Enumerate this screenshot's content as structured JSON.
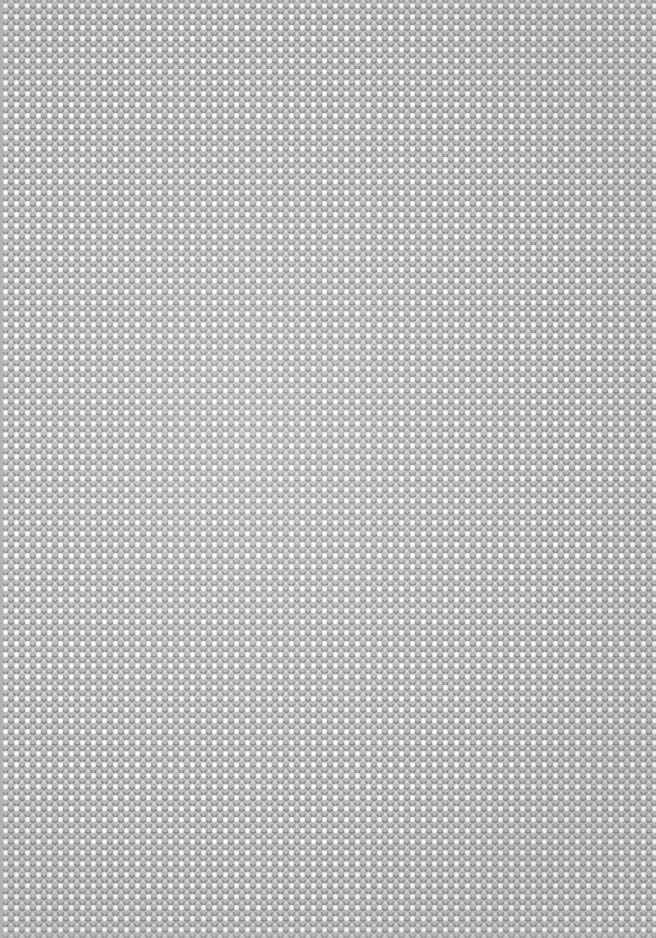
{
  "image": {
    "kind": "abstract-texture",
    "description": "Seamless pixelated halftone dot-lattice weave texture filling the entire frame",
    "width": 656,
    "height": 938,
    "has_text": false,
    "has_ui_controls": false
  },
  "pattern": {
    "name": "dot-lattice-weave",
    "motif": "bright round dots on a square lattice with half-period offset dimmer dots, separated by dark diagonal diamond crosshatching",
    "period_px": 11,
    "period_x_px": 11,
    "period_y_px": 11,
    "lattice": "square",
    "secondary_lattice": "quincunx (offset by half period)",
    "dot_diameter_px": 3.4,
    "dim_dot_diameter_px": 3.1,
    "rendering": "nearest-neighbour pixelated",
    "diagonal_angles_deg": [
      45,
      -45
    ]
  },
  "colors": {
    "base_grey": "#b9b9b9",
    "weave_dark": "#6e6e6e",
    "dot_highlight": "#ffffff",
    "dim_dot": "#f2f2f2",
    "edge_margin_grey": "#b0b0b0",
    "page_backdrop": "#9c9c9c"
  },
  "regions": {
    "left_margin_strip_width_px": 4,
    "vignette_center": "38% 46%",
    "vignette_note": "centre-left reads slightly brighter, corners marginally darker"
  }
}
